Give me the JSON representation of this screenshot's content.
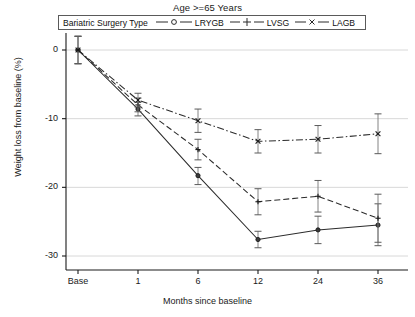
{
  "chart_data": {
    "type": "line",
    "title": "Age >=65 Years",
    "xlabel": "Months since baseline",
    "ylabel": "Weight loss from baseline (%)",
    "x_categories": [
      "Base",
      "1",
      "6",
      "12",
      "24",
      "36"
    ],
    "y_ticks": [
      "0",
      "-10",
      "-20",
      "-30"
    ],
    "y_tick_values": [
      0,
      -10,
      -20,
      -30
    ],
    "ylim": [
      -31,
      3
    ],
    "grid": true,
    "legend_position": "top-center",
    "legend_title": "Bariatric Surgery Type",
    "series": [
      {
        "name": "LRYGB",
        "marker": "circle",
        "line_style": "solid",
        "values": [
          0,
          -8.6,
          -18.3,
          -27.6,
          -26.2,
          -25.5
        ],
        "err_low": [
          -2.0,
          -9.6,
          -19.6,
          -28.8,
          -28.2,
          -28.5
        ],
        "err_high": [
          2.0,
          -7.6,
          -17.1,
          -26.4,
          -24.2,
          -22.4
        ]
      },
      {
        "name": "LVSG",
        "marker": "plus",
        "line_style": "dashed",
        "values": [
          0,
          -8.0,
          -14.5,
          -22.1,
          -21.3,
          -24.5
        ],
        "err_low": [
          -2.0,
          -9.0,
          -16.0,
          -24.0,
          -23.6,
          -28.0
        ],
        "err_high": [
          2.0,
          -7.0,
          -13.0,
          -20.2,
          -19.0,
          -21.0
        ]
      },
      {
        "name": "LAGB",
        "marker": "x",
        "line_style": "dashdot",
        "values": [
          0,
          -7.3,
          -10.3,
          -13.3,
          -13.0,
          -12.2
        ],
        "err_low": [
          -2.0,
          -8.3,
          -12.0,
          -15.0,
          -15.0,
          -15.1
        ],
        "err_high": [
          2.0,
          -6.3,
          -8.6,
          -11.6,
          -11.0,
          -9.3
        ]
      }
    ]
  },
  "colors": {
    "axis": "#1a1a1a",
    "grid": "#d8d8d8",
    "series": "#2b2b2b",
    "legend_border": "#5a5a5a"
  }
}
